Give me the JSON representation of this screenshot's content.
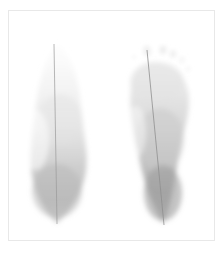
{
  "image": {
    "type": "plantar-pressure-footprint-scan",
    "width": 224,
    "height": 253,
    "background_color": "#ffffff",
    "has_text_labels": false,
    "title": ""
  },
  "frame": {
    "name": "scan-border-frame",
    "x": 8,
    "y": 10,
    "width": 206,
    "height": 230,
    "stroke_color": "#e8e8e8",
    "stroke_width": 1,
    "fill_color": "#ffffff"
  },
  "palette": {
    "background": "#ffffff",
    "frame_stroke": "#e8e8e8",
    "print_lightest": "#f6f6f6",
    "print_light": "#ececec",
    "print_mid": "#d8d8d8",
    "print_dark": "#bdbdbd",
    "print_darkest": "#a8a8a8",
    "axis_line": "#9a9a9a"
  },
  "feet": [
    {
      "id": "left-foot",
      "label": "Left footprint",
      "side": "left",
      "center_x": 57,
      "top_y": 46,
      "bottom_y": 222,
      "max_width": 56,
      "forefoot_intensity": "very-faint",
      "midfoot_intensity": "faint",
      "heel_intensity": "moderate",
      "toes_visible": false,
      "toe_count": 0,
      "axis_line": {
        "name": "left-foot-axis-line",
        "x1": 54,
        "y1": 44,
        "x2": 57,
        "y2": 224,
        "color": "#9a9a9a",
        "width": 0.7
      },
      "gradient_stops": [
        {
          "offset": 0.0,
          "color": "#fcfcfc",
          "opacity": 0.55
        },
        {
          "offset": 0.22,
          "color": "#f2f2f2",
          "opacity": 0.8
        },
        {
          "offset": 0.45,
          "color": "#e6e6e6",
          "opacity": 0.92
        },
        {
          "offset": 0.68,
          "color": "#cfcfcf",
          "opacity": 1.0
        },
        {
          "offset": 0.88,
          "color": "#bcbcbc",
          "opacity": 1.0
        },
        {
          "offset": 1.0,
          "color": "#c8c8c8",
          "opacity": 0.85
        }
      ]
    },
    {
      "id": "right-foot",
      "label": "Right footprint",
      "side": "right",
      "center_x": 155,
      "top_y": 52,
      "bottom_y": 224,
      "max_width": 60,
      "forefoot_intensity": "light",
      "midfoot_intensity": "moderate",
      "heel_intensity": "dark",
      "toes_visible": true,
      "toe_count": 5,
      "axis_line": {
        "name": "right-foot-axis-line",
        "x1": 147,
        "y1": 50,
        "x2": 164,
        "y2": 225,
        "color": "#8f8f8f",
        "width": 0.8
      },
      "gradient_stops": [
        {
          "offset": 0.0,
          "color": "#f0f0f0",
          "opacity": 0.8
        },
        {
          "offset": 0.2,
          "color": "#e4e4e4",
          "opacity": 0.95
        },
        {
          "offset": 0.42,
          "color": "#d6d6d6",
          "opacity": 1.0
        },
        {
          "offset": 0.62,
          "color": "#c2c2c2",
          "opacity": 1.0
        },
        {
          "offset": 0.82,
          "color": "#ababab",
          "opacity": 1.0
        },
        {
          "offset": 1.0,
          "color": "#b4b4b4",
          "opacity": 0.88
        }
      ],
      "toes": [
        {
          "id": "toe-1-hallux",
          "label": "Hallux (big toe)",
          "cx": 147,
          "cy": 51,
          "rx": 4.0,
          "ry": 5.5,
          "rotate": -8,
          "color": "#ededed",
          "opacity": 0.85
        },
        {
          "id": "toe-2",
          "label": "Second toe",
          "cx": 163,
          "cy": 50,
          "rx": 3.4,
          "ry": 4.2,
          "rotate": 4,
          "color": "#e9e9e9",
          "opacity": 0.82
        },
        {
          "id": "toe-3",
          "label": "Third toe",
          "cx": 173,
          "cy": 54,
          "rx": 3.2,
          "ry": 3.8,
          "rotate": 10,
          "color": "#ebebeb",
          "opacity": 0.78
        },
        {
          "id": "toe-4",
          "label": "Fourth toe",
          "cx": 182,
          "cy": 60,
          "rx": 2.8,
          "ry": 3.2,
          "rotate": 18,
          "color": "#efefef",
          "opacity": 0.7
        },
        {
          "id": "toe-5",
          "label": "Fifth toe",
          "cx": 188,
          "cy": 69,
          "rx": 2.4,
          "ry": 2.8,
          "rotate": 26,
          "color": "#f1f1f1",
          "opacity": 0.62
        },
        {
          "id": "toe-speck-left",
          "label": "Medial speck",
          "cx": 134,
          "cy": 57,
          "rx": 2.2,
          "ry": 2.0,
          "rotate": 0,
          "color": "#f0f0f0",
          "opacity": 0.6
        }
      ]
    }
  ]
}
